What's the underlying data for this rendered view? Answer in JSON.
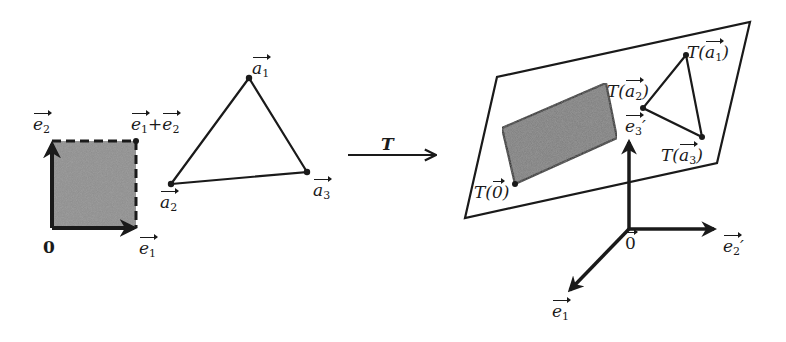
{
  "figure": {
    "colors": {
      "ink": "#1a1a1a",
      "shade": "#8a8a8a",
      "background": "#ffffff"
    },
    "left_panel": {
      "origin_label": "0",
      "e1_label": "e",
      "e1_sub": "1",
      "e2_label": "e",
      "e2_sub": "2",
      "corner_label_a": "e",
      "corner_sub_a": "1",
      "corner_plus": "+",
      "corner_label_b": "e",
      "corner_sub_b": "2",
      "triangle": {
        "a1": {
          "label": "a",
          "sub": "1"
        },
        "a2": {
          "label": "a",
          "sub": "2"
        },
        "a3": {
          "label": "a",
          "sub": "3"
        }
      }
    },
    "mapping_arrow": {
      "label": "T"
    },
    "right_panel": {
      "T_prefix": "T(",
      "T_suffix": ")",
      "image_origin_inner": "0",
      "T_a1": {
        "label": "a",
        "sub": "1"
      },
      "T_a2": {
        "label": "a",
        "sub": "2"
      },
      "T_a3": {
        "label": "a",
        "sub": "3"
      },
      "axes": {
        "origin_label": "0",
        "e1_label": "e",
        "e1_sub": "1",
        "e2_label": "e",
        "e2_sub": "2",
        "e3_label": "e",
        "e3_sub": "3",
        "prime": "′"
      }
    }
  }
}
